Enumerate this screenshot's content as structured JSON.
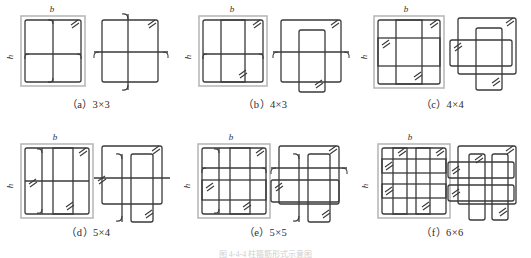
{
  "figure": {
    "title_truncated": "图 4-4-4  柱箍筋形式示意图",
    "dimension_labels": {
      "width": "b",
      "height": "h"
    },
    "panels": [
      {
        "id": "a",
        "caption": "（a）3×3",
        "cols": 3,
        "rows": 3,
        "label_b": "b",
        "label_h": "h"
      },
      {
        "id": "b",
        "caption": "（b）4×3",
        "cols": 4,
        "rows": 3,
        "label_b": "b",
        "label_h": "h"
      },
      {
        "id": "c",
        "caption": "（c）4×4",
        "cols": 4,
        "rows": 4,
        "label_b": "b",
        "label_h": "h"
      },
      {
        "id": "d",
        "caption": "（d）5×4",
        "cols": 5,
        "rows": 4,
        "label_b": "b",
        "label_h": "h"
      },
      {
        "id": "e",
        "caption": "（e）5×5",
        "cols": 5,
        "rows": 5,
        "label_b": "b",
        "label_h": "h"
      },
      {
        "id": "f",
        "caption": "（f）6×6",
        "cols": 6,
        "rows": 6,
        "label_b": "b",
        "label_h": "h"
      }
    ],
    "colors": {
      "concrete_outline": "#b9b9b9",
      "stirrup": "#3a3a3a",
      "caption_text": "#2b2b2b",
      "background": "#ffffff"
    }
  }
}
